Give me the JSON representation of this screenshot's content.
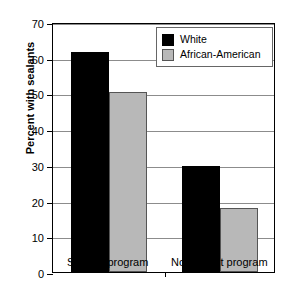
{
  "chart_data": {
    "type": "bar",
    "title": "",
    "xlabel": "",
    "ylabel": "Percent with sealants",
    "categories": [
      "Sealant program",
      "No sealant program"
    ],
    "series": [
      {
        "name": "White",
        "color": "#000000",
        "values": [
          61.5,
          29.8
        ]
      },
      {
        "name": "African-American",
        "color": "#b8b8b8",
        "values": [
          50.5,
          17.8
        ]
      }
    ],
    "ylim": [
      0,
      70
    ],
    "ytick_values": [
      0,
      10,
      20,
      30,
      40,
      50,
      60,
      70
    ],
    "ytick_labels": [
      "0",
      "10",
      "20",
      "30",
      "40",
      "50",
      "60",
      "70"
    ],
    "grid": true,
    "legend_position": "top-right"
  },
  "legend": {
    "entries": [
      {
        "label": "White",
        "swatch": "black-swatch"
      },
      {
        "label": "African-American",
        "swatch": "gray-swatch"
      }
    ]
  },
  "axes": {
    "y_title": "Percent with sealants",
    "y_ticks": [
      "70",
      "60",
      "50",
      "40",
      "30",
      "20",
      "10",
      "0"
    ],
    "x_ticks": [
      "Sealant program",
      "No sealant program"
    ]
  }
}
